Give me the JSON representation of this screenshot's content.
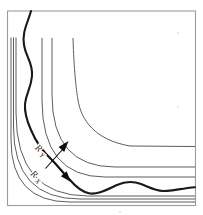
{
  "figure": {
    "type": "streamline-corner-diagram",
    "labels": {
      "ry": {
        "base": "R",
        "sub": "Y"
      },
      "rx": {
        "base": "R",
        "sub": "X"
      }
    },
    "colors": {
      "frame": "#9c9c9c",
      "thin_line": "#4b4b4b",
      "thick_line": "#191919",
      "arrow": "#0c0c0c",
      "background": "#ffffff"
    },
    "paths": {
      "streamlines": [
        "M 11 37.5 L 11 140 Q 11 202 70 202 L 195 202",
        "M 13.5 37.5 L 13.5 127 Q 13.5 199 80 199 L 195 199",
        "M 16 37.5 L 16 113 Q 16 196 88 196 L 195 196",
        "M 42 38 L 42 100 Q 42 177 105 177 L 195 177",
        "M 52 38 L 52 95 Q 52 167 115 167 L 195 167",
        "M 73 38 C 74 70 76 88 78 100 C 81 120 95 140 130 146 L 195 146.5"
      ],
      "thick_streamline": "M 31 11 C 27 25 22 32 24 45 C 26 58 33 62 32 76 C 31 89 26 93 25 104 C 24.3 113 27 121 31 130 C 36 142 43 152 52 160 C 58 166 64 174 70 180 C 76 187 81 191.5 89 193.3 C 97 195 106 190 117 185 C 125 181.3 133 181 141 184 C 149 187 155 190.6 163 191 C 171 191.4 181 188.4 195 187.2",
      "arrow_up_shaft": "M 45.5 168.5 L 62.5 149.5",
      "arrow_down_shaft": "M 43.5 150.5 L 64.5 174.5",
      "arrow_up_head": "68.5,141 64.2,152 58.6,147",
      "arrow_down_head": "71,182 60.9,176.2 66.6,171.2"
    }
  }
}
